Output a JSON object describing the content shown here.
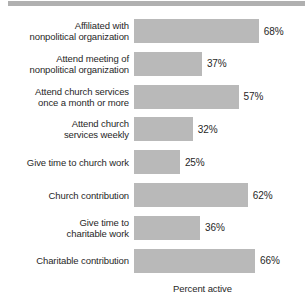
{
  "chart_data": {
    "type": "bar",
    "orientation": "horizontal",
    "title": "",
    "xlabel": "Percent active",
    "ylabel": "",
    "xlim": [
      0,
      100
    ],
    "grid": false,
    "legend": null,
    "value_suffix": "%",
    "categories": [
      "Affiliated with\nnonpolitical organization",
      "Attend meeting of\nnonpolitical organization",
      "Attend church services\nonce a month or more",
      "Attend church\nservices weekly",
      "Give time to church work",
      "Church contribution",
      "Give time to\ncharitable work",
      "Charitable contribution"
    ],
    "values": [
      68,
      37,
      57,
      32,
      25,
      62,
      36,
      66
    ],
    "value_labels": [
      "68%",
      "37%",
      "57%",
      "32%",
      "25%",
      "62%",
      "36%",
      "66%"
    ],
    "bar_color": "#b9b9b9",
    "text_color": "#272727",
    "background_color": "#ffffff"
  },
  "header": {
    "band_color": "#b0b0b0"
  },
  "axis": {
    "x_title": "Percent active"
  },
  "rows": [
    {
      "label": "Affiliated with\nnonpolitical organization",
      "value": 68,
      "value_label": "68%"
    },
    {
      "label": "Attend meeting of\nnonpolitical organization",
      "value": 37,
      "value_label": "37%"
    },
    {
      "label": "Attend church services\nonce a month or more",
      "value": 57,
      "value_label": "57%"
    },
    {
      "label": "Attend church\nservices weekly",
      "value": 32,
      "value_label": "32%"
    },
    {
      "label": "Give time to church work",
      "value": 25,
      "value_label": "25%"
    },
    {
      "label": "Church contribution",
      "value": 62,
      "value_label": "62%"
    },
    {
      "label": "Give time to\ncharitable work",
      "value": 36,
      "value_label": "36%"
    },
    {
      "label": "Charitable contribution",
      "value": 66,
      "value_label": "66%"
    }
  ]
}
